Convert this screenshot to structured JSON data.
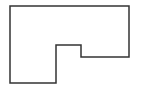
{
  "diagram": {
    "type": "polygon-outline",
    "stroke_color": "#333333",
    "fill_color": "#ffffff",
    "background": "#ffffff",
    "points": "10,6 129,6 129,57 81,57 81,45 56,45 56,83 10,83"
  }
}
